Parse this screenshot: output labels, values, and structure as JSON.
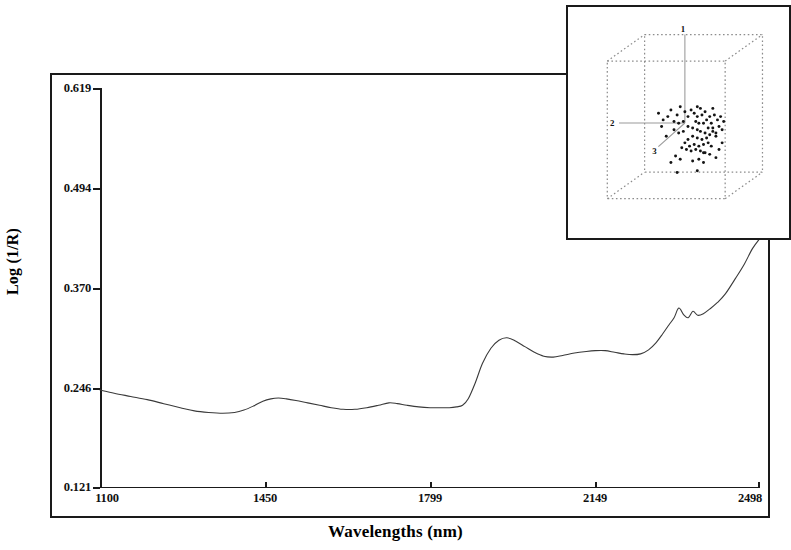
{
  "figure": {
    "background_color": "#ffffff",
    "frame_color": "#1a1a1a",
    "curve_color": "#3a3a3a"
  },
  "axes": {
    "x_title": "Wavelengths (nm)",
    "y_title": "Log (1/R)",
    "x_tick_labels": [
      "1100",
      "1450",
      "1799",
      "2149",
      "2498"
    ],
    "y_tick_labels": [
      "0.619",
      "0.494",
      "0.370",
      "0.246",
      "0.121"
    ]
  },
  "inset": {
    "axis_label_1": "1",
    "axis_label_2": "2",
    "axis_label_3": "3"
  },
  "chart_data": {
    "type": "line",
    "title": "",
    "subtitle": "",
    "xlabel": "Wavelengths (nm)",
    "ylabel": "Log (1/R)",
    "xlim": [
      1100,
      2498
    ],
    "ylim": [
      0.121,
      0.619
    ],
    "xticks": [
      1100,
      1450,
      1799,
      2149,
      2498
    ],
    "yticks": [
      0.121,
      0.246,
      0.37,
      0.494,
      0.619
    ],
    "grid": false,
    "legend": false,
    "series": [
      {
        "name": "NIR reflectance spectrum",
        "x": [
          1100,
          1130,
          1165,
          1200,
          1235,
          1270,
          1300,
          1330,
          1360,
          1385,
          1405,
          1425,
          1445,
          1462,
          1478,
          1495,
          1515,
          1540,
          1565,
          1590,
          1615,
          1640,
          1665,
          1690,
          1712,
          1730,
          1750,
          1775,
          1799,
          1820,
          1840,
          1855,
          1868,
          1880,
          1895,
          1910,
          1928,
          1945,
          1962,
          1980,
          2000,
          2020,
          2040,
          2060,
          2080,
          2105,
          2130,
          2149,
          2170,
          2190,
          2210,
          2228,
          2245,
          2262,
          2278,
          2292,
          2305,
          2316,
          2326,
          2336,
          2346,
          2356,
          2366,
          2378,
          2392,
          2408,
          2425,
          2445,
          2465,
          2482,
          2498
        ],
        "y": [
          0.243,
          0.239,
          0.235,
          0.231,
          0.226,
          0.221,
          0.217,
          0.215,
          0.214,
          0.215,
          0.218,
          0.223,
          0.229,
          0.232,
          0.233,
          0.232,
          0.23,
          0.227,
          0.224,
          0.221,
          0.219,
          0.219,
          0.221,
          0.224,
          0.227,
          0.226,
          0.224,
          0.222,
          0.221,
          0.221,
          0.221,
          0.222,
          0.224,
          0.232,
          0.252,
          0.276,
          0.295,
          0.305,
          0.308,
          0.304,
          0.297,
          0.29,
          0.285,
          0.284,
          0.286,
          0.289,
          0.291,
          0.292,
          0.292,
          0.29,
          0.288,
          0.287,
          0.288,
          0.293,
          0.302,
          0.313,
          0.324,
          0.333,
          0.345,
          0.337,
          0.333,
          0.341,
          0.336,
          0.338,
          0.344,
          0.352,
          0.363,
          0.381,
          0.4,
          0.419,
          0.432
        ]
      }
    ]
  },
  "inset_chart_data": {
    "type": "scatter",
    "title": "",
    "projection": "3d",
    "axis_labels": [
      "1",
      "2",
      "3"
    ],
    "box": "dotted wireframe cube",
    "point_count": 78,
    "points": [
      [
        0.62,
        0.72
      ],
      [
        0.7,
        0.6
      ],
      [
        0.74,
        0.66
      ],
      [
        0.58,
        0.44
      ],
      [
        0.47,
        0.44
      ],
      [
        0.41,
        0.46
      ],
      [
        0.5,
        0.47
      ],
      [
        0.45,
        0.49
      ],
      [
        0.52,
        0.5
      ],
      [
        0.54,
        0.46
      ],
      [
        0.56,
        0.48
      ],
      [
        0.58,
        0.5
      ],
      [
        0.6,
        0.45
      ],
      [
        0.61,
        0.49
      ],
      [
        0.63,
        0.47
      ],
      [
        0.57,
        0.53
      ],
      [
        0.59,
        0.54
      ],
      [
        0.62,
        0.54
      ],
      [
        0.64,
        0.52
      ],
      [
        0.66,
        0.5
      ],
      [
        0.67,
        0.54
      ],
      [
        0.69,
        0.49
      ],
      [
        0.71,
        0.52
      ],
      [
        0.73,
        0.5
      ],
      [
        0.75,
        0.53
      ],
      [
        0.72,
        0.56
      ],
      [
        0.68,
        0.57
      ],
      [
        0.65,
        0.57
      ],
      [
        0.33,
        0.48
      ],
      [
        0.36,
        0.52
      ],
      [
        0.39,
        0.5
      ],
      [
        0.43,
        0.53
      ],
      [
        0.46,
        0.54
      ],
      [
        0.49,
        0.53
      ],
      [
        0.52,
        0.56
      ],
      [
        0.55,
        0.57
      ],
      [
        0.58,
        0.58
      ],
      [
        0.6,
        0.59
      ],
      [
        0.63,
        0.6
      ],
      [
        0.66,
        0.61
      ],
      [
        0.68,
        0.59
      ],
      [
        0.7,
        0.62
      ],
      [
        0.64,
        0.63
      ],
      [
        0.61,
        0.64
      ],
      [
        0.58,
        0.63
      ],
      [
        0.55,
        0.62
      ],
      [
        0.52,
        0.64
      ],
      [
        0.5,
        0.66
      ],
      [
        0.53,
        0.68
      ],
      [
        0.56,
        0.67
      ],
      [
        0.59,
        0.68
      ],
      [
        0.62,
        0.67
      ],
      [
        0.65,
        0.66
      ],
      [
        0.67,
        0.68
      ],
      [
        0.57,
        0.7
      ],
      [
        0.54,
        0.71
      ],
      [
        0.51,
        0.7
      ],
      [
        0.48,
        0.69
      ],
      [
        0.6,
        0.71
      ],
      [
        0.63,
        0.72
      ],
      [
        0.66,
        0.73
      ],
      [
        0.44,
        0.74
      ],
      [
        0.47,
        0.76
      ],
      [
        0.41,
        0.78
      ],
      [
        0.55,
        0.77
      ],
      [
        0.59,
        0.76
      ],
      [
        0.62,
        0.78
      ],
      [
        0.7,
        0.75
      ],
      [
        0.72,
        0.7
      ],
      [
        0.74,
        0.58
      ],
      [
        0.38,
        0.62
      ],
      [
        0.35,
        0.56
      ],
      [
        0.43,
        0.58
      ],
      [
        0.46,
        0.6
      ],
      [
        0.49,
        0.59
      ],
      [
        0.45,
        0.84
      ],
      [
        0.58,
        0.83
      ],
      [
        0.68,
        0.45
      ]
    ]
  }
}
